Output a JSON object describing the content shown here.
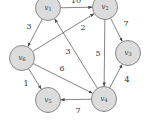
{
  "diagram": {
    "type": "directed-weighted-graph",
    "nodes": [
      {
        "id": "v1",
        "label": "v",
        "sub": "1"
      },
      {
        "id": "v2",
        "label": "v",
        "sub": "2"
      },
      {
        "id": "v3",
        "label": "v",
        "sub": "3"
      },
      {
        "id": "v4",
        "label": "v",
        "sub": "4"
      },
      {
        "id": "v5",
        "label": "v",
        "sub": "5"
      },
      {
        "id": "v6",
        "label": "v",
        "sub": "6"
      }
    ],
    "edges": [
      {
        "from": "v1",
        "to": "v2",
        "weight": "10"
      },
      {
        "from": "v1",
        "to": "v6",
        "weight": "3"
      },
      {
        "from": "v6",
        "to": "v2",
        "weight": "2"
      },
      {
        "from": "v4",
        "to": "v1",
        "weight": "3"
      },
      {
        "from": "v2",
        "to": "v4",
        "weight": "5"
      },
      {
        "from": "v2",
        "to": "v3",
        "weight": "7"
      },
      {
        "from": "v4",
        "to": "v3",
        "weight": "4"
      },
      {
        "from": "v6",
        "to": "v4",
        "weight": "6"
      },
      {
        "from": "v6",
        "to": "v5",
        "weight": "1"
      },
      {
        "from": "v4",
        "to": "v5",
        "weight": "7"
      }
    ]
  }
}
